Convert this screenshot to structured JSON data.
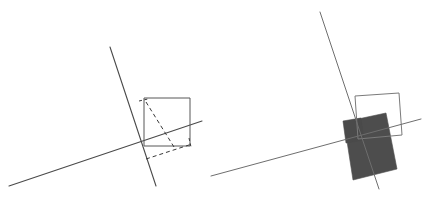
{
  "document": {
    "title": "Geometric transformation figure",
    "background_color": "#ffffff",
    "width": 425,
    "height": 204
  },
  "style": {
    "line_color": "#4a4a4a",
    "line_color_light": "#6e6e6e",
    "square_outline_color": "#555555",
    "dashed_color": "#3a3a3a",
    "fill_color": "#4d4d4d",
    "stroke_width": 1,
    "dash_pattern": "4 3"
  },
  "panels": [
    {
      "id": "left-panel",
      "name": "left-figure",
      "label": "",
      "axes": [
        {
          "name": "steep-line",
          "x1": 110,
          "y1": 47,
          "x2": 156,
          "y2": 186
        },
        {
          "name": "shallow-line",
          "x1": 9,
          "y1": 186,
          "x2": 202,
          "y2": 121
        }
      ],
      "square": {
        "name": "square-outline",
        "points": "144,98 190,98 190,146 144,146"
      },
      "dashed_shapes": [
        {
          "name": "dashed-diagonal-upper",
          "points": "141,101 149,99"
        },
        {
          "name": "dashed-slanted-side",
          "points": "146,103 173,147"
        },
        {
          "name": "dashed-lower-edge",
          "points": "146,158 191,144"
        },
        {
          "name": "dashed-right-tick",
          "points": "188,140 191,146"
        }
      ]
    },
    {
      "id": "right-panel",
      "name": "right-figure",
      "label": "",
      "axes": [
        {
          "name": "steep-line",
          "x1": 320,
          "y1": 12,
          "x2": 379,
          "y2": 189
        },
        {
          "name": "shallow-line",
          "x1": 211,
          "y1": 176,
          "x2": 421,
          "y2": 119
        }
      ],
      "square": {
        "name": "square-outline",
        "points": "355,96 399,93 402,135 358,139"
      },
      "filled_shape": {
        "name": "shaded-square",
        "points": "344,122 386,114 396,169 353,179"
      },
      "filled_shape_secondary": {
        "name": "shaded-square-notch",
        "points": "344,122 360,119 363,139 347,142"
      }
    }
  ]
}
